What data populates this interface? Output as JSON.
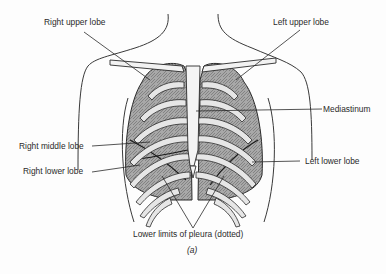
{
  "figure": {
    "caption": "(a)",
    "labels": {
      "right_upper_lobe": "Right upper lobe",
      "left_upper_lobe": "Left upper lobe",
      "mediastinum": "Mediastinum",
      "right_middle_lobe": "Right middle lobe",
      "right_lower_lobe": "Right lower lobe",
      "left_lower_lobe": "Left lower lobe",
      "lower_limits_pleura": "Lower limits of pleura (dotted)"
    },
    "colors": {
      "ink": "#2a2a2a",
      "lung_fill": "#9a9a9a",
      "rib_fill": "#e6e6e6",
      "background": "#fdfdfd"
    }
  }
}
